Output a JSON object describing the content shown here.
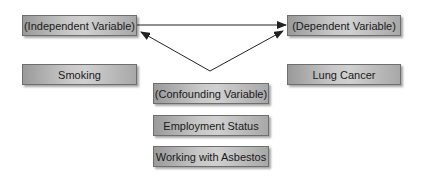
{
  "diagram": {
    "independent_label": "(Independent Variable)",
    "dependent_label": "(Dependent Variable)",
    "confounding_label": "(Confounding Variable)",
    "independent_example": "Smoking",
    "dependent_example": "Lung Cancer",
    "confounders": [
      "Employment Status",
      "Working with Asbestos"
    ]
  },
  "colors": {
    "box_border": "#6e6e6e",
    "arrow": "#222222",
    "background": "#ffffff"
  }
}
